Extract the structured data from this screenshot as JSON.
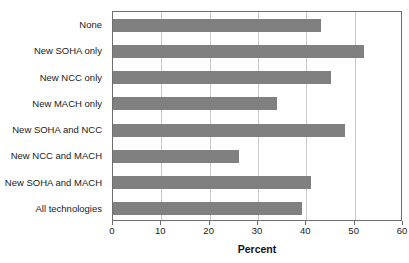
{
  "chart_data": {
    "type": "bar",
    "orientation": "horizontal",
    "title": "",
    "xlabel": "Percent",
    "ylabel": "",
    "xlim": [
      0,
      60
    ],
    "xticks": [
      0,
      10,
      20,
      30,
      40,
      50,
      60
    ],
    "xtick_labels": [
      "0",
      "10",
      "20",
      "30",
      "40",
      "50",
      "60"
    ],
    "grid": true,
    "grid_axis": "x",
    "legend": false,
    "bar_color": "#808080",
    "categories": [
      "None",
      "New SOHA only",
      "New NCC only",
      "New MACH only",
      "New SOHA and NCC",
      "New NCC and MACH",
      "New SOHA and MACH",
      "All technologies"
    ],
    "values": [
      43,
      52,
      45,
      34,
      48,
      26,
      41,
      39
    ]
  },
  "axis": {
    "x_title": "Percent"
  }
}
